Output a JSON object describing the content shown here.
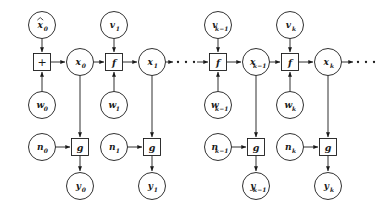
{
  "diagram": {
    "type": "signal-flow-graph",
    "background_color": "#ffffff",
    "stroke_color": "#1a1a1a",
    "geometry": {
      "width": 384,
      "height": 211,
      "circle_radius": 13.5,
      "box_size": 17,
      "rows": {
        "input_top": 25,
        "state": 62,
        "noise_w": 105,
        "measure": 147,
        "output": 186
      }
    },
    "columns": [
      {
        "id": "step-0",
        "operator_x": 42,
        "state_x": 80,
        "aux_x": 42,
        "operator_label": "+",
        "operator_kind": "sum",
        "top_node": {
          "base": "x",
          "sub": "0",
          "hat": true
        },
        "state_node": {
          "base": "x",
          "sub": "0",
          "hat": false
        },
        "w_node": {
          "base": "w",
          "sub": "0",
          "hat": false
        },
        "n_node": {
          "base": "n",
          "sub": "0",
          "hat": false
        },
        "g_label": "g",
        "y_node": {
          "base": "y",
          "sub": "0",
          "hat": false
        }
      },
      {
        "id": "step-1",
        "operator_x": 114,
        "state_x": 152,
        "aux_x": 114,
        "operator_label": "f",
        "operator_kind": "function",
        "top_node": {
          "base": "v",
          "sub": "1",
          "hat": false
        },
        "state_node": {
          "base": "x",
          "sub": "1",
          "hat": false
        },
        "w_node": {
          "base": "w",
          "sub": "1",
          "hat": false
        },
        "n_node": {
          "base": "n",
          "sub": "1",
          "hat": false
        },
        "g_label": "g",
        "y_node": {
          "base": "y",
          "sub": "1",
          "hat": false
        }
      },
      {
        "id": "step-k-minus-1",
        "operator_x": 218,
        "state_x": 256,
        "aux_x": 218,
        "operator_label": "f",
        "operator_kind": "function",
        "top_node": {
          "base": "v",
          "sub": "k−1",
          "hat": false
        },
        "state_node": {
          "base": "x",
          "sub": "k−1",
          "hat": false
        },
        "w_node": {
          "base": "w",
          "sub": "k−1",
          "hat": false
        },
        "n_node": {
          "base": "n",
          "sub": "k−1",
          "hat": false
        },
        "g_label": "g",
        "y_node": {
          "base": "y",
          "sub": "k−1",
          "hat": false
        }
      },
      {
        "id": "step-k",
        "operator_x": 290,
        "state_x": 328,
        "aux_x": 290,
        "operator_label": "f",
        "operator_kind": "function",
        "top_node": {
          "base": "v",
          "sub": "k",
          "hat": false
        },
        "state_node": {
          "base": "x",
          "sub": "k",
          "hat": false
        },
        "w_node": {
          "base": "w",
          "sub": "k",
          "hat": false
        },
        "n_node": {
          "base": "n",
          "sub": "k",
          "hat": false
        },
        "g_label": "g",
        "y_node": {
          "base": "y",
          "sub": "k",
          "hat": false
        }
      }
    ],
    "ellipses": [
      {
        "id": "ellipsis-mid",
        "x": 186,
        "y": 62,
        "dots": 3,
        "has_arrow": true
      },
      {
        "id": "ellipsis-end",
        "x": 366,
        "y": 62,
        "dots": 3,
        "has_arrow": false
      }
    ]
  }
}
